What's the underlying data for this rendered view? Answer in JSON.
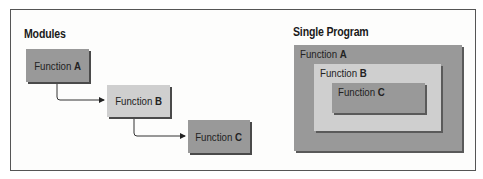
{
  "diagram": {
    "modules": {
      "title": "Modules",
      "boxes": [
        {
          "prefix": "Function",
          "name": "A",
          "shade": "dark"
        },
        {
          "prefix": "Function",
          "name": "B",
          "shade": "light"
        },
        {
          "prefix": "Function",
          "name": "C",
          "shade": "dark"
        }
      ],
      "connections": [
        {
          "from": "A",
          "to": "B",
          "type": "arrow"
        },
        {
          "from": "B",
          "to": "C",
          "type": "arrow"
        }
      ]
    },
    "single_program": {
      "title": "Single Program",
      "nested": [
        {
          "prefix": "Function",
          "name": "A",
          "shade": "dark",
          "level": 0
        },
        {
          "prefix": "Function",
          "name": "B",
          "shade": "light",
          "level": 1
        },
        {
          "prefix": "Function",
          "name": "C",
          "shade": "dark",
          "level": 2
        }
      ]
    },
    "colors": {
      "dark": "#999999",
      "light": "#cfcfcf",
      "border": "#555555",
      "shadow": "#4a4a4a"
    }
  }
}
